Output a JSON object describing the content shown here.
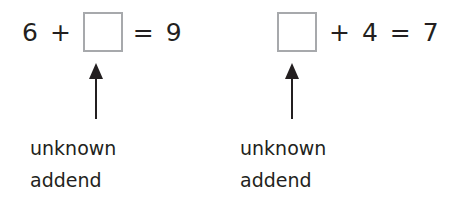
{
  "equations": [
    {
      "tokens": [
        "6",
        "+",
        "",
        "=",
        "9"
      ],
      "unknown_position": 2,
      "label_line1": "unknown",
      "label_line2": "addend"
    },
    {
      "tokens": [
        "",
        "+",
        "4",
        "=",
        "7"
      ],
      "unknown_position": 0,
      "label_line1": "unknown",
      "label_line2": "addend"
    }
  ],
  "colors": {
    "text": "#231f20",
    "box_border": "#a7a9ac",
    "arrow": "#231f20"
  }
}
